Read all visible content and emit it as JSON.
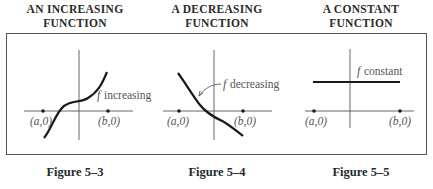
{
  "panels": [
    {
      "title_line1": "AN INCREASING",
      "title_line2": "FUNCTION",
      "curve_label_f": "f",
      "curve_label": "increasing",
      "point_a": "(a,0)",
      "point_b": "(b,0)",
      "caption": "Figure 5–3"
    },
    {
      "title_line1": "A DECREASING",
      "title_line2": "FUNCTION",
      "curve_label_f": "f",
      "curve_label": "decreasing",
      "point_a": "(a,0)",
      "point_b": "(b,0)",
      "caption": "Figure 5–4"
    },
    {
      "title_line1": "A CONSTANT",
      "title_line2": "FUNCTION",
      "curve_label_f": "f",
      "curve_label": "constant",
      "point_a": "(a,0)",
      "point_b": "(b,0)",
      "caption": "Figure 5–5"
    }
  ],
  "colors": {
    "line": "#1a1a1a",
    "axis": "#555555",
    "label": "#555555"
  }
}
